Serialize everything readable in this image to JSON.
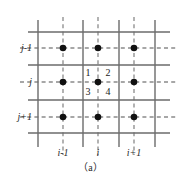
{
  "figure": {
    "caption": "（a）",
    "row_labels": [
      {
        "text": "j-1",
        "y": 48
      },
      {
        "text": "j",
        "y": 82
      },
      {
        "text": "j+1",
        "y": 117
      }
    ],
    "col_labels": [
      {
        "text": "i-1",
        "x": 63
      },
      {
        "text": "i",
        "x": 98
      },
      {
        "text": "i+1",
        "x": 134
      }
    ],
    "quadrant_labels": [
      {
        "text": "1",
        "x": 88,
        "y": 73
      },
      {
        "text": "2",
        "x": 108,
        "y": 73
      },
      {
        "text": "3",
        "x": 88,
        "y": 92
      },
      {
        "text": "4",
        "x": 108,
        "y": 92
      }
    ]
  },
  "chart_data": {
    "type": "diagram",
    "title": "（a）",
    "xlabel": "",
    "ylabel": "",
    "solid_vertical_x": [
      38,
      83,
      119,
      155
    ],
    "dashed_vertical_x": [
      63,
      98,
      134
    ],
    "solid_horizontal_y": [
      32,
      65,
      100,
      133
    ],
    "dashed_horizontal_y": [
      48,
      82,
      117
    ],
    "solid_h_extent": [
      28,
      170
    ],
    "solid_v_extent": [
      20,
      147
    ],
    "dashed_h_extent": [
      20,
      178
    ],
    "dashed_v_extent": [
      17,
      155
    ],
    "node_radius": 3.3,
    "nodes": [
      {
        "x": 63,
        "y": 48,
        "i": "i-1",
        "j": "j-1"
      },
      {
        "x": 98,
        "y": 48,
        "i": "i",
        "j": "j-1"
      },
      {
        "x": 134,
        "y": 48,
        "i": "i+1",
        "j": "j-1"
      },
      {
        "x": 63,
        "y": 82,
        "i": "i-1",
        "j": "j"
      },
      {
        "x": 98,
        "y": 82,
        "i": "i",
        "j": "j"
      },
      {
        "x": 134,
        "y": 82,
        "i": "i+1",
        "j": "j"
      },
      {
        "x": 63,
        "y": 117,
        "i": "i-1",
        "j": "j+1"
      },
      {
        "x": 98,
        "y": 117,
        "i": "i",
        "j": "j+1"
      },
      {
        "x": 134,
        "y": 117,
        "i": "i+1",
        "j": "j+1"
      }
    ],
    "colors": {
      "solid_line": "#6b6b6b",
      "dashed_line": "#8a8a8a",
      "node_fill": "#111111",
      "text": "#2a2a2a",
      "background": "#ffffff"
    },
    "legend": [],
    "grid": true
  }
}
